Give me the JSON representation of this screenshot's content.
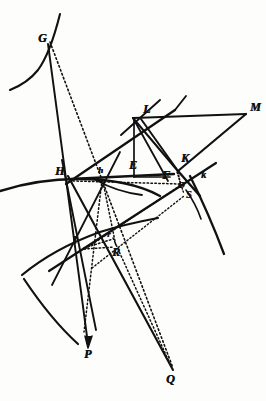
{
  "figure": {
    "caption": "",
    "ink_color": "#111111",
    "paper_color": "#fdfdfb",
    "width": 266,
    "height": 401
  },
  "points": [
    {
      "id": "G",
      "label": "G",
      "x": 38,
      "y": 38,
      "size": "lg"
    },
    {
      "id": "L",
      "label": "L",
      "x": 143,
      "y": 110,
      "size": "lg"
    },
    {
      "id": "M",
      "label": "M",
      "x": 250,
      "y": 108,
      "size": "lg"
    },
    {
      "id": "E",
      "label": "E",
      "x": 129,
      "y": 166,
      "size": "lg"
    },
    {
      "id": "K",
      "label": "K",
      "x": 181,
      "y": 159,
      "size": "lg"
    },
    {
      "id": "H",
      "label": "H",
      "x": 55,
      "y": 172,
      "size": "lg"
    },
    {
      "id": "h",
      "label": "h",
      "x": 98,
      "y": 172,
      "size": "sm"
    },
    {
      "id": "F",
      "label": "F",
      "x": 162,
      "y": 176,
      "size": "lg"
    },
    {
      "id": "k",
      "label": "k",
      "x": 201,
      "y": 177,
      "size": "md"
    },
    {
      "id": "O",
      "label": "O",
      "x": 178,
      "y": 186,
      "size": "sm"
    },
    {
      "id": "S",
      "label": "S",
      "x": 187,
      "y": 196,
      "size": "md"
    },
    {
      "id": "I",
      "label": "I",
      "x": 72,
      "y": 241,
      "size": "lg"
    },
    {
      "id": "r",
      "label": "r",
      "x": 107,
      "y": 236,
      "size": "sm"
    },
    {
      "id": "R",
      "label": "R",
      "x": 112,
      "y": 253,
      "size": "lg"
    },
    {
      "id": "P",
      "label": "P",
      "x": 84,
      "y": 355,
      "size": "lg"
    },
    {
      "id": "Q",
      "label": "Q",
      "x": 166,
      "y": 380,
      "size": "lg"
    }
  ],
  "coordinates": {
    "G": [
      48,
      44
    ],
    "L": [
      133,
      118
    ],
    "M": [
      246,
      114
    ],
    "E": [
      133,
      176
    ],
    "K": [
      178,
      171
    ],
    "H": [
      71,
      179
    ],
    "h": [
      104,
      179
    ],
    "F": [
      170,
      182
    ],
    "k": [
      196,
      187
    ],
    "O": [
      180,
      184
    ],
    "S": [
      183,
      192
    ],
    "I": [
      83,
      248
    ],
    "r": [
      112,
      240
    ],
    "R": [
      113,
      246
    ],
    "P": [
      88,
      344
    ],
    "Q": [
      173,
      370
    ]
  },
  "strokes": {
    "solid": [
      {
        "name": "G-to-P-line",
        "from": "G",
        "to": "P"
      },
      {
        "name": "L-to-M-line",
        "from": "L",
        "to": "M"
      },
      {
        "name": "M-to-K-line",
        "from": "M",
        "to": "K"
      },
      {
        "name": "L-to-K-line",
        "from": "L",
        "to": "K"
      },
      {
        "name": "L-to-F-line",
        "from": "L",
        "to": "F"
      },
      {
        "name": "L-to-E-line",
        "from": "L",
        "to": "E"
      },
      {
        "name": "H-to-F-line",
        "from": "H",
        "to": "F"
      },
      {
        "name": "H-to-L-line",
        "from": "H",
        "to": "L"
      },
      {
        "name": "E-to-F-line",
        "from": "E",
        "to": "F"
      },
      {
        "name": "H-to-Q-line",
        "from": "H",
        "to": "Q"
      },
      {
        "name": "K-through-S-line",
        "from": "K",
        "to": "S"
      },
      {
        "name": "I-to-K-line",
        "from": "I",
        "to": "K"
      }
    ],
    "dotted": [
      {
        "name": "G-to-Q-dotted",
        "from": "G",
        "to": "Q"
      },
      {
        "name": "h-to-R-dotted",
        "from": "h",
        "to": "R"
      },
      {
        "name": "H-to-O-dotted",
        "from": "H",
        "to": "O"
      },
      {
        "name": "I-to-O-dotted",
        "from": "I",
        "to": "O"
      },
      {
        "name": "I-to-r-dotted",
        "from": "I",
        "to": "r"
      },
      {
        "name": "K-to-O-dotted",
        "from": "K",
        "to": "O"
      },
      {
        "name": "K-to-S-dotted",
        "from": "K",
        "to": "S"
      },
      {
        "name": "I-to-R-dotted",
        "from": "I",
        "to": "R"
      }
    ],
    "arcs": [
      {
        "name": "upper-left-arc",
        "description": "arc near G curving down-left"
      },
      {
        "name": "arc-through-H",
        "description": "long arc passing through H"
      },
      {
        "name": "arc-through-I",
        "description": "arc passing through I to lower left"
      },
      {
        "name": "arc-near-F",
        "description": "short arc left of F"
      },
      {
        "name": "arc-right-of-K",
        "description": "arc descending right of K"
      }
    ]
  }
}
